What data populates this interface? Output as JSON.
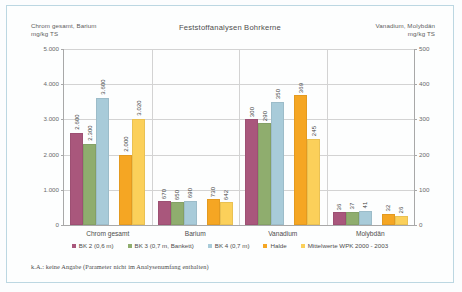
{
  "chart_data": {
    "type": "bar",
    "title": "Feststoffanalysen Bohrkerne",
    "categories": [
      "Chrom gesamt",
      "Barium",
      "Vanadium",
      "Molybdän"
    ],
    "series": [
      {
        "name": "BK 2 (0,6 m)",
        "color": "#a9577c",
        "values": [
          2600,
          670,
          300,
          36
        ]
      },
      {
        "name": "BK 3 (0,7 m, Bankett)",
        "color": "#8fad6e",
        "values": [
          2300,
          650,
          290,
          37
        ]
      },
      {
        "name": "BK 4 (0,7 m)",
        "color": "#a8cbd9",
        "values": [
          3600,
          690,
          350,
          41
        ]
      },
      {
        "name": "Halde",
        "color": "#f5a623",
        "values": [
          2000,
          730,
          369,
          32
        ]
      },
      {
        "name": "Mittelwerte WPK 2000 - 2003",
        "color": "#fbd05a",
        "values": [
          3020,
          642,
          245,
          26
        ]
      }
    ],
    "value_labels": {
      "Chrom gesamt": [
        "2.600",
        "2.300",
        "3.600",
        "2.000",
        "3.020"
      ],
      "Barium": [
        "670",
        "650",
        "690",
        "730",
        "642"
      ],
      "Vanadium": [
        "300",
        "290",
        "350",
        "369",
        "245"
      ],
      "Molybdän": [
        "36",
        "37",
        "41",
        "32",
        "26"
      ]
    },
    "axis_assignment": {
      "Chrom gesamt": "left",
      "Barium": "left",
      "Vanadium": "right",
      "Molybdän": "right"
    },
    "left_axis": {
      "label": "Chrom gesamt, Barium\nmg/kg TS",
      "ticks": [
        "0",
        "1.000",
        "2.000",
        "3.000",
        "4.000",
        "5.000"
      ],
      "min": 0,
      "max": 5000
    },
    "right_axis": {
      "label": "Vanadium, Molybdän\nmg/kg TS",
      "ticks": [
        "0",
        "100",
        "200",
        "300",
        "400",
        "500"
      ],
      "min": 0,
      "max": 500
    },
    "grid": true,
    "legend_position": "bottom",
    "xlabel": "",
    "ylabel": "mg/kg TS"
  },
  "footnote": "k.A.: keine Angabe (Parameter nicht im Analysenumfang enthalten)"
}
